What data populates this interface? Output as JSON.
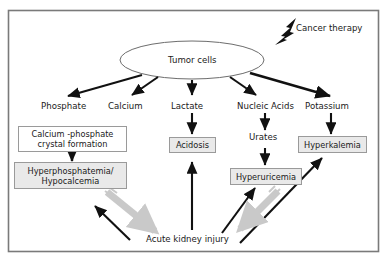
{
  "figure": {
    "kind": "medical-pathophysiology-flowchart",
    "frame_color": "#7a7a7a",
    "accent_gray_arrow": "#c9c9c9",
    "box_gray_fill": "#e9e9e9",
    "box_border": "#9a9a9a",
    "text_color": "#1a1a1a"
  },
  "nodes": {
    "trigger": {
      "label": "Cancer therapy"
    },
    "source": {
      "label": "Tumor cells"
    },
    "releases": [
      {
        "id": "phosphate",
        "label": "Phosphate"
      },
      {
        "id": "calcium",
        "label": "Calcium"
      },
      {
        "id": "lactate",
        "label": "Lactate"
      },
      {
        "id": "nucleic-acids",
        "label": "Nucleic Acids"
      },
      {
        "id": "potassium",
        "label": "Potassium"
      }
    ],
    "intermediates": [
      {
        "id": "urates",
        "label": "Urates"
      }
    ],
    "boxes": [
      {
        "id": "calcium-phosphate-crystal",
        "label": "Calcium -phosphate\ncrystal formation",
        "fill": "white"
      },
      {
        "id": "hyperphosphatemia-hypocalcemia",
        "label": "Hyperphosphatemia/\nHypocalcemia",
        "fill": "gray"
      },
      {
        "id": "acidosis",
        "label": "Acidosis",
        "fill": "gray"
      },
      {
        "id": "hyperuricemia",
        "label": "Hyperuricemia",
        "fill": "gray"
      },
      {
        "id": "hyperkalemia",
        "label": "Hyperkalemia",
        "fill": "gray"
      }
    ],
    "outcome": {
      "id": "acute-kidney-injury",
      "label": "Acute kidney injury"
    }
  },
  "edges": {
    "from_tumor": [
      "Phosphate",
      "Calcium",
      "Lactate",
      "Nucleic Acids",
      "Potassium"
    ],
    "black_down": [
      "Lactate -> Acidosis",
      "Nucleic Acids -> Urates",
      "Urates -> Hyperuricemia",
      "Potassium -> Hyperkalemia",
      "Calcium -phosphate crystal formation -> Hyperphosphatemia/Hypocalcemia"
    ],
    "black_up_to_injury": [
      "Acute kidney injury -> Calcium -phosphate crystal formation",
      "Acute kidney injury -> Acidosis",
      "Acute kidney injury -> Hyperuricemia",
      "Acute kidney injury -> Hyperkalemia"
    ],
    "gray_down_to_injury": [
      "Hyperphosphatemia/Hypocalcemia -> Acute kidney injury",
      "Hyperuricemia -> Acute kidney injury"
    ]
  }
}
